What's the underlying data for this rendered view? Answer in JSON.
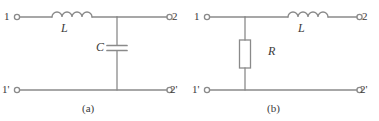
{
  "figure": {
    "background_color": "#ffffff",
    "line_color": "#8a8a8a",
    "text_color": "#3a3a3a",
    "circuits": [
      {
        "id": "a",
        "caption": "(a)",
        "topology": "series-inductor-shunt-capacitor",
        "terminals": {
          "input_top": "1",
          "input_bottom": "1'",
          "output_top": "2",
          "output_bottom": "2'"
        },
        "components": [
          {
            "name": "inductor",
            "label": "L",
            "orientation": "horizontal",
            "branch": "series-top"
          },
          {
            "name": "capacitor",
            "label": "C",
            "orientation": "vertical",
            "branch": "shunt"
          }
        ]
      },
      {
        "id": "b",
        "caption": "(b)",
        "topology": "shunt-resistor-series-inductor",
        "terminals": {
          "input_top": "1",
          "input_bottom": "1'",
          "output_top": "2",
          "output_bottom": "2'"
        },
        "components": [
          {
            "name": "resistor",
            "label": "R",
            "orientation": "vertical",
            "branch": "shunt"
          },
          {
            "name": "inductor",
            "label": "L",
            "orientation": "horizontal",
            "branch": "series-top"
          }
        ]
      }
    ]
  }
}
